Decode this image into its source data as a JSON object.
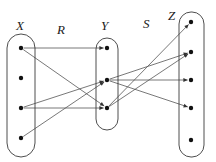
{
  "figure": {
    "width": 216,
    "height": 162,
    "background": "#ffffff",
    "stroke_color": "#555555",
    "outline_color": "#3a3a3a",
    "dot_color": "#111111",
    "label_color": "#1a1a1a"
  },
  "labels": {
    "set_x": "X",
    "set_y": "Y",
    "set_z": "Z",
    "relation_r": "R",
    "relation_s": "S"
  },
  "label_positions": {
    "set_x": {
      "x": 16,
      "y": 30
    },
    "set_y": {
      "x": 101,
      "y": 30
    },
    "set_z": {
      "x": 168,
      "y": 20
    },
    "relation_r": {
      "x": 57,
      "y": 34
    },
    "relation_s": {
      "x": 143,
      "y": 28
    }
  },
  "sets": [
    {
      "name": "X",
      "outline": {
        "x": 7,
        "y": 34,
        "width": 28,
        "height": 123,
        "rx": 14
      },
      "elements": [
        {
          "id": "x1",
          "cx": 21,
          "cy": 48
        },
        {
          "id": "x2",
          "cx": 21,
          "cy": 78
        },
        {
          "id": "x3",
          "cx": 21,
          "cy": 108
        },
        {
          "id": "x4",
          "cx": 21,
          "cy": 138
        }
      ]
    },
    {
      "name": "Y",
      "outline": {
        "x": 96,
        "y": 38,
        "width": 22,
        "height": 92,
        "rx": 11
      },
      "elements": [
        {
          "id": "y1",
          "cx": 107,
          "cy": 48
        },
        {
          "id": "y2",
          "cx": 107,
          "cy": 80
        },
        {
          "id": "y3",
          "cx": 107,
          "cy": 108
        }
      ]
    },
    {
      "name": "Z",
      "outline": {
        "x": 179,
        "y": 12,
        "width": 25,
        "height": 145,
        "rx": 12
      },
      "elements": [
        {
          "id": "z1",
          "cx": 191,
          "cy": 22
        },
        {
          "id": "z2",
          "cx": 191,
          "cy": 52
        },
        {
          "id": "z3",
          "cx": 191,
          "cy": 80
        },
        {
          "id": "z4",
          "cx": 191,
          "cy": 108
        },
        {
          "id": "z5",
          "cx": 191,
          "cy": 140
        }
      ]
    }
  ],
  "edges": {
    "R": [
      {
        "from": "x1",
        "to": "y1",
        "x1": 21,
        "y1": 48,
        "x2": 107,
        "y2": 48
      },
      {
        "from": "x1",
        "to": "y3",
        "x1": 21,
        "y1": 48,
        "x2": 107,
        "y2": 108
      },
      {
        "from": "x3",
        "to": "y2",
        "x1": 21,
        "y1": 108,
        "x2": 107,
        "y2": 80
      },
      {
        "from": "x3",
        "to": "y3",
        "x1": 21,
        "y1": 108,
        "x2": 107,
        "y2": 108
      },
      {
        "from": "x4",
        "to": "y2",
        "x1": 21,
        "y1": 138,
        "x2": 107,
        "y2": 80
      }
    ],
    "S": [
      {
        "from": "y1",
        "to": "z1",
        "x1": 107,
        "y1": 108,
        "x2": 191,
        "y2": 22
      },
      {
        "from": "y3",
        "to": "z2",
        "x1": 107,
        "y1": 108,
        "x2": 191,
        "y2": 52
      },
      {
        "from": "y2",
        "to": "z2",
        "x1": 107,
        "y1": 80,
        "x2": 191,
        "y2": 52
      },
      {
        "from": "y2",
        "to": "z3",
        "x1": 107,
        "y1": 80,
        "x2": 191,
        "y2": 80
      },
      {
        "from": "y2",
        "to": "z4",
        "x1": 107,
        "y1": 80,
        "x2": 191,
        "y2": 108
      }
    ]
  },
  "dot_radius": 2.2,
  "element_counts": {
    "X": 4,
    "Y": 3,
    "Z": 5
  }
}
